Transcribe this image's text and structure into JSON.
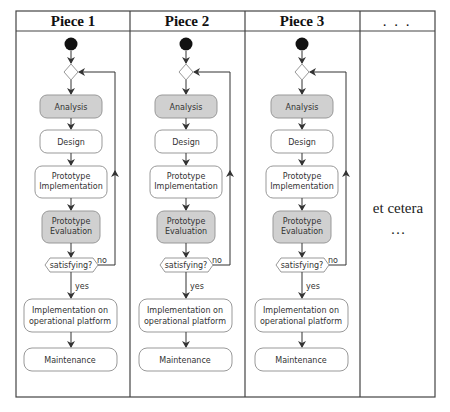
{
  "columns": [
    {
      "header": "Piece 1"
    },
    {
      "header": "Piece 2"
    },
    {
      "header": "Piece 3"
    },
    {
      "header": ". . ."
    }
  ],
  "flow": {
    "analysis": "Analysis",
    "design": "Design",
    "proto_impl_1": "Prototype",
    "proto_impl_2": "Implementation",
    "proto_eval_1": "Prototype",
    "proto_eval_2": "Evaluation",
    "decision": "satisfying?",
    "no_label": "no",
    "yes_label": "yes",
    "impl_op_1": "Implementation on",
    "impl_op_2": "operational platform",
    "maintenance": "Maintenance"
  },
  "etc": {
    "text": "et cetera",
    "dots": "…"
  },
  "colors": {
    "activity_gray": "#d0d0d0",
    "activity_white": "#ffffff",
    "stroke": "#999999",
    "line": "#333333"
  }
}
